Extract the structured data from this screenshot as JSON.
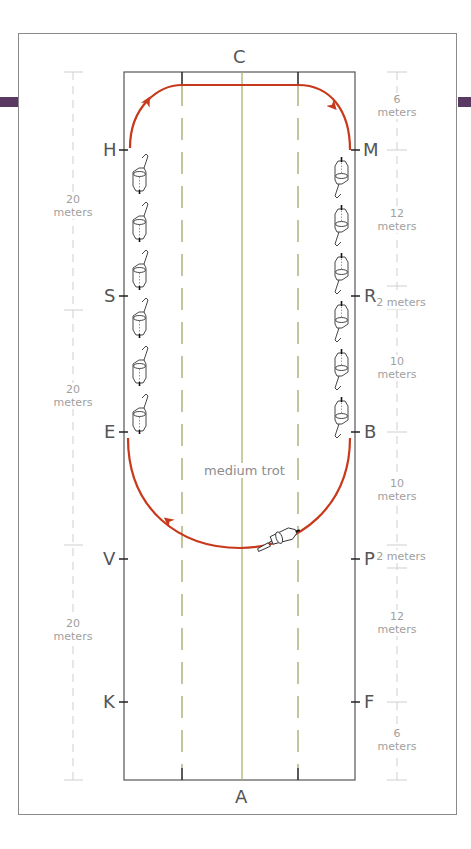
{
  "diagram": {
    "type": "dressage-arena",
    "colors": {
      "arena_border": "#555555",
      "path": "#c8391c",
      "quarter_lines": "#9aa05a",
      "centerline": "#a6ab5e",
      "dimension": "#c8c8c8",
      "accent_tab": "#5a3a63"
    },
    "ends": {
      "top": "C",
      "bottom": "A"
    },
    "left_markers": [
      "H",
      "S",
      "E",
      "V",
      "K"
    ],
    "right_markers": [
      "M",
      "R",
      "B",
      "P",
      "F"
    ],
    "path_label": "medium trot",
    "left_dimensions": [
      {
        "value": "20",
        "unit": "meters"
      },
      {
        "value": "20",
        "unit": "meters"
      },
      {
        "value": "20",
        "unit": "meters"
      }
    ],
    "right_dimensions": [
      {
        "value": "6",
        "unit": "meters"
      },
      {
        "value": "12",
        "unit": "meters"
      },
      {
        "value": "2 meters"
      },
      {
        "value": "10",
        "unit": "meters"
      },
      {
        "value": "10",
        "unit": "meters"
      },
      {
        "value": "2 meters"
      },
      {
        "value": "12",
        "unit": "meters"
      },
      {
        "value": "6",
        "unit": "meters"
      }
    ]
  }
}
